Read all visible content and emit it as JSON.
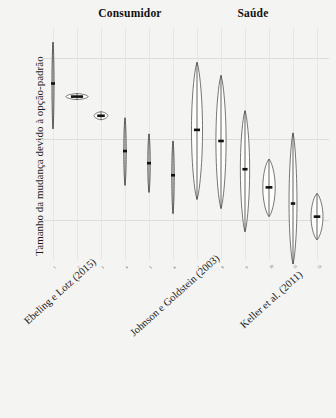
{
  "chart_data": {
    "type": "violin",
    "title": "",
    "xlabel": "",
    "ylabel": "Tamanho da mudança devido à opção-padrão",
    "ylim": [
      -20,
      95
    ],
    "grid": true,
    "legend": false,
    "facets": [
      {
        "label": "Consumidor",
        "positions": [
          1,
          2,
          3,
          4,
          5,
          6,
          7
        ]
      },
      {
        "label": "Saúde",
        "positions": [
          8,
          9,
          10,
          11,
          12
        ]
      }
    ],
    "ytick_labels": [
      "80%",
      "40%",
      "0%"
    ],
    "ytick_values": [
      80,
      40,
      0
    ],
    "xtick_labels": [
      "1",
      "2",
      "3",
      "4",
      "5",
      "6",
      "7",
      "8",
      "9",
      "10",
      "11",
      "12"
    ],
    "study_labels": [
      "Ebeling e Lotz (2015)",
      "Johnson e Goldstein (2003)",
      "Keller et al. (2011)"
    ],
    "series": [
      {
        "name": "1",
        "median": 67.5,
        "low": 88.0,
        "high": 45.0,
        "width": 0.1,
        "shape": "line"
      },
      {
        "name": "2",
        "median": 61.0,
        "low": 62.5,
        "high": 59.5,
        "width": 1.0,
        "shape": "lens"
      },
      {
        "name": "3",
        "median": 51.5,
        "low": 53.5,
        "high": 49.5,
        "width": 0.62,
        "shape": "lens"
      },
      {
        "name": "4",
        "median": 34.0,
        "low": 50.5,
        "high": 17.0,
        "width": 0.12,
        "shape": "line"
      },
      {
        "name": "5",
        "median": 28.0,
        "low": 42.5,
        "high": 13.5,
        "width": 0.12,
        "shape": "line"
      },
      {
        "name": "6",
        "median": 22.0,
        "low": 39.0,
        "high": 3.0,
        "width": 0.12,
        "shape": "line"
      },
      {
        "name": "7",
        "median": 44.5,
        "low": 78.0,
        "high": 10.0,
        "width": 0.5,
        "shape": "lens"
      },
      {
        "name": "8",
        "median": 39.0,
        "low": 71.5,
        "high": 5.5,
        "width": 0.46,
        "shape": "lens"
      },
      {
        "name": "9",
        "median": 25.0,
        "low": 54.0,
        "high": -6.0,
        "width": 0.42,
        "shape": "lens"
      },
      {
        "name": "10",
        "median": 16.0,
        "low": 30.0,
        "high": 1.5,
        "width": 0.56,
        "shape": "lens"
      },
      {
        "name": "11",
        "median": 8.0,
        "low": 43.0,
        "high": -22.0,
        "width": 0.36,
        "shape": "lens"
      },
      {
        "name": "12",
        "median": 1.5,
        "low": 13.0,
        "high": -10.0,
        "width": 0.54,
        "shape": "lens"
      }
    ]
  },
  "header": {
    "consumidor": "Consumidor",
    "saude": "Saúde"
  },
  "axis": {
    "y_title": "Tamanho da mudança devido à opção-padrão"
  }
}
